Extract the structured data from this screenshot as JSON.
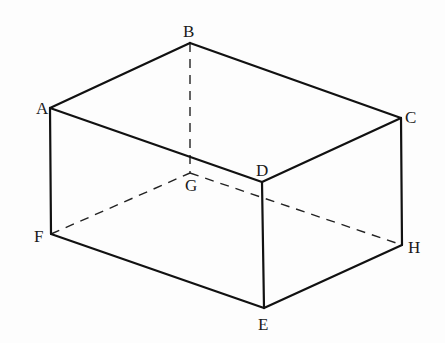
{
  "diagram": {
    "type": "rectangular-prism",
    "vertices": {
      "A": {
        "label": "A",
        "x": 50,
        "y": 108,
        "lx": 36,
        "ly": 114
      },
      "B": {
        "label": "B",
        "x": 190,
        "y": 43,
        "lx": 183,
        "ly": 37
      },
      "C": {
        "label": "C",
        "x": 401,
        "y": 118,
        "lx": 405,
        "ly": 123
      },
      "D": {
        "label": "D",
        "x": 262,
        "y": 182,
        "lx": 256,
        "ly": 176
      },
      "E": {
        "label": "E",
        "x": 264,
        "y": 308,
        "lx": 258,
        "ly": 330
      },
      "F": {
        "label": "F",
        "x": 51,
        "y": 234,
        "lx": 34,
        "ly": 242
      },
      "G": {
        "label": "G",
        "x": 190,
        "y": 173,
        "lx": 185,
        "ly": 191
      },
      "H": {
        "label": "H",
        "x": 402,
        "y": 245,
        "lx": 408,
        "ly": 253
      }
    },
    "visible_edges": [
      [
        "A",
        "B"
      ],
      [
        "B",
        "C"
      ],
      [
        "C",
        "D"
      ],
      [
        "D",
        "A"
      ],
      [
        "A",
        "F"
      ],
      [
        "D",
        "E"
      ],
      [
        "C",
        "H"
      ],
      [
        "F",
        "E"
      ],
      [
        "E",
        "H"
      ]
    ],
    "hidden_edges": [
      [
        "B",
        "G"
      ],
      [
        "F",
        "G"
      ],
      [
        "G",
        "H"
      ]
    ],
    "colors": {
      "line": "#111111",
      "label": "#1a1a1a",
      "background": "#fdfdfd"
    }
  }
}
